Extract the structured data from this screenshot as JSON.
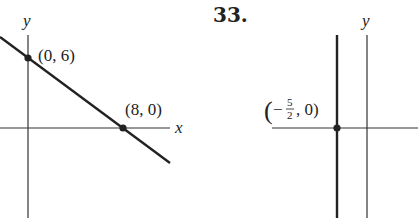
{
  "problem_number": "33.",
  "left_graph": {
    "x_axis_label": "x",
    "y_axis_label": "y",
    "points": [
      {
        "label": "(0, 6)",
        "x": 0,
        "y": 6
      },
      {
        "label": "(8, 0)",
        "x": 8,
        "y": 0
      }
    ],
    "line": "through (0, 6) and (8, 0)"
  },
  "right_graph": {
    "y_axis_label": "y",
    "point": {
      "label_open": "(",
      "label_sign": "−",
      "frac_num": "5",
      "frac_den": "2",
      "label_rest": ", 0)",
      "x": -2.5,
      "y": 0
    },
    "line": "vertical line x = -5/2"
  },
  "colors": {
    "ink": "#222222",
    "background": "#ffffff"
  }
}
